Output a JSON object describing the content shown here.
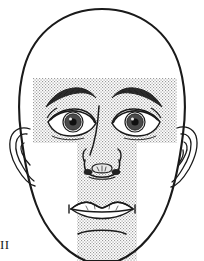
{
  "figure": {
    "corner_mark": "II",
    "colors": {
      "outline": "#1a1a1a",
      "stipple_dot": "#8a8a8a",
      "background": "#ffffff",
      "iris_fill": "#3a3a3a",
      "pupil_fill": "#111111"
    }
  },
  "shaded_regions": [
    {
      "name": "horizontal-band",
      "label": "upper-face-band",
      "description": "stippled band across brows and eyes",
      "x": 33,
      "y": 78,
      "width": 144,
      "height": 65
    },
    {
      "name": "vertical-band",
      "label": "central-face-band",
      "description": "stippled band down nose, mouth and chin",
      "x": 77,
      "y": 78,
      "width": 60,
      "height": 183
    }
  ],
  "features": [
    {
      "name": "head-outline",
      "label": "Head outline"
    },
    {
      "name": "left-ear",
      "label": "Left ear"
    },
    {
      "name": "right-ear",
      "label": "Right ear"
    },
    {
      "name": "left-eyebrow",
      "label": "Left eyebrow"
    },
    {
      "name": "right-eyebrow",
      "label": "Right eyebrow"
    },
    {
      "name": "left-eye",
      "label": "Left eye"
    },
    {
      "name": "right-eye",
      "label": "Right eye"
    },
    {
      "name": "nose",
      "label": "Nose"
    },
    {
      "name": "mouth",
      "label": "Mouth"
    },
    {
      "name": "chin-crease",
      "label": "Chin crease"
    }
  ]
}
